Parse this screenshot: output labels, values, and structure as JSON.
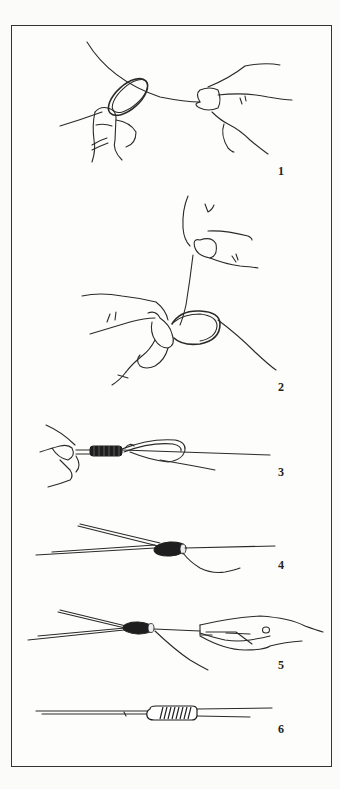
{
  "figure": {
    "colors": {
      "ink": "#2a2a2a",
      "paper": "#fdfdfb",
      "frame": "#333333"
    },
    "steps": [
      {
        "number": "1",
        "depicts": "two hands forming a loop in the line"
      },
      {
        "number": "2",
        "depicts": "hands pinching loop while tag end is pulled upward"
      },
      {
        "number": "3",
        "depicts": "line wrapped around loop held between fingers"
      },
      {
        "number": "4",
        "depicts": "wraps cinched into a knot with tag end"
      },
      {
        "number": "5",
        "depicts": "pliers pulling the knot tight"
      },
      {
        "number": "6",
        "depicts": "finished knot with neat coils"
      }
    ]
  }
}
